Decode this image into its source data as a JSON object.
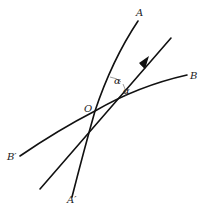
{
  "diagram": {
    "labels": {
      "A": "A",
      "A_prime": "A′",
      "B": "B",
      "B_prime": "B′",
      "O": "O",
      "alpha_upper": "α",
      "alpha_lower": "α"
    },
    "origin": {
      "x": 95,
      "y": 111
    },
    "curves": [
      {
        "name": "curve-AA'",
        "from": "A'",
        "to": "A"
      },
      {
        "name": "curve-BB'",
        "from": "B'",
        "to": "B"
      }
    ],
    "ray": {
      "name": "direction-ray",
      "has_arrow": true
    },
    "colors": {
      "stroke": "#111111",
      "text": "#222222",
      "background": "#ffffff"
    }
  }
}
